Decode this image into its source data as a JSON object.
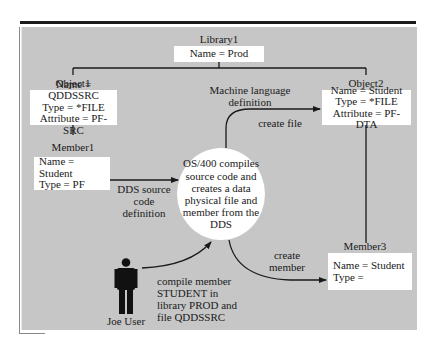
{
  "diagram": {
    "library": {
      "title": "Library1",
      "name": "Name = Prod"
    },
    "object1": {
      "title": "Object1",
      "lines": [
        "Name = QDDSSRC",
        "Type = *FILE",
        "Attribute = PF-SRC"
      ]
    },
    "object2": {
      "title": "Object2",
      "lines": [
        "Name = Student",
        "Type = *FILE",
        "Attribute = PF-DTA"
      ]
    },
    "member1": {
      "title": "Member1",
      "lines": [
        "Name = Student",
        "Type = PF"
      ]
    },
    "member3": {
      "title": "Member3",
      "lines": [
        "Name = Student",
        "Type ="
      ]
    },
    "process": {
      "text": "OS/400 compiles\nsource code and\ncreates a data\nphysical file and\nmember from the\nDDS"
    },
    "actor": {
      "name": "Joe User",
      "icon": "person-icon"
    },
    "edges": {
      "dds_source": "DDS source\ncode definition",
      "machine_language": "Machine language\ndefinition",
      "create_file": "create file",
      "create_member": "create\nmember",
      "compile_member": "compile member\nSTUDENT in\nlibrary PROD and\nfile QDDSSRC"
    },
    "colors": {
      "background": "#c6c6c6",
      "box": "#ffffff",
      "line": "#1a1a1a"
    }
  }
}
